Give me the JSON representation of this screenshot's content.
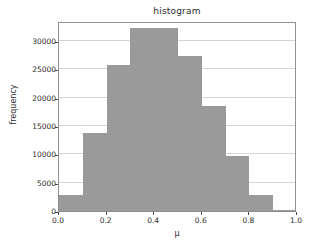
{
  "chart_data": {
    "type": "bar",
    "title": "histogram",
    "xlabel": "μ",
    "ylabel": "frequency",
    "grid": true,
    "legend": null,
    "xlim": [
      0.0,
      1.0
    ],
    "ylim": [
      0,
      33500
    ],
    "xticks": [
      0.0,
      0.2,
      0.4,
      0.6,
      0.8,
      1.0
    ],
    "xtick_labels": [
      "0.0",
      "0.2",
      "0.4",
      "0.6",
      "0.8",
      "1.0"
    ],
    "yticks": [
      0,
      5000,
      10000,
      15000,
      20000,
      25000,
      30000
    ],
    "ytick_labels": [
      "0",
      "5000",
      "10000",
      "15000",
      "20000",
      "25000",
      "30000"
    ],
    "bin_edges": [
      0.0,
      0.1,
      0.2,
      0.3,
      0.4,
      0.5,
      0.6,
      0.7,
      0.8,
      0.9,
      1.0
    ],
    "bin_centers": [
      0.05,
      0.15,
      0.25,
      0.35,
      0.45,
      0.55,
      0.65,
      0.75,
      0.85,
      0.95
    ],
    "categories": [
      "0.0-0.1",
      "0.1-0.2",
      "0.2-0.3",
      "0.3-0.4",
      "0.4-0.5",
      "0.5-0.6",
      "0.6-0.7",
      "0.7-0.8",
      "0.8-0.9",
      "0.9-1.0"
    ],
    "values": [
      2900,
      13800,
      25700,
      32300,
      32300,
      27300,
      18600,
      9700,
      2900,
      200
    ],
    "bar_color": "#9a9a9a",
    "grid_color": "#d4d4d4",
    "axes_color": "#8f8f8f"
  }
}
